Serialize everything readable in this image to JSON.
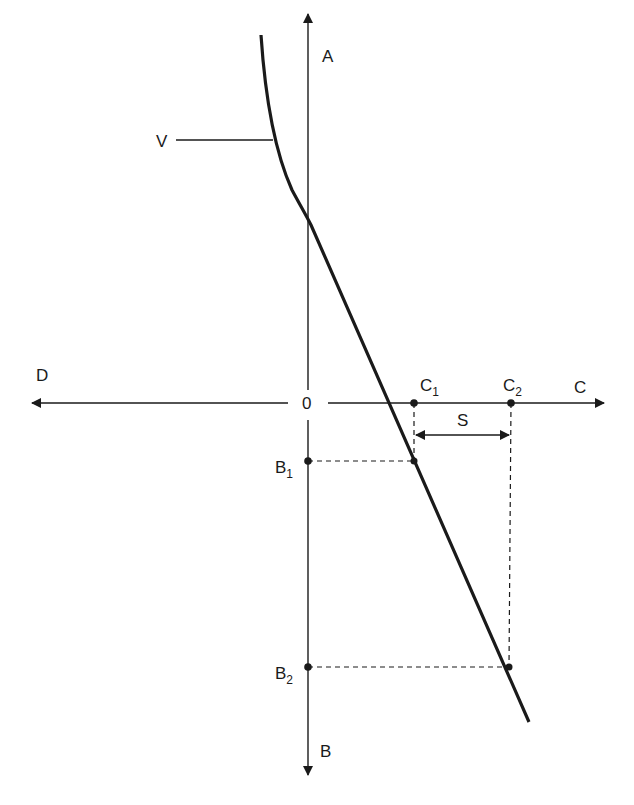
{
  "diagram": {
    "type": "axis-curve-diagram",
    "colors": {
      "line": "#1a1a1a",
      "background": "#ffffff"
    },
    "axes": {
      "origin_label": "0",
      "up_label": "A",
      "down_label": "B",
      "right_label": "C",
      "left_label": "D"
    },
    "curve": {
      "label": "V"
    },
    "points": {
      "c1": {
        "label": "C",
        "subscript": "1"
      },
      "c2": {
        "label": "C",
        "subscript": "2"
      },
      "b1": {
        "label": "B",
        "subscript": "1"
      },
      "b2": {
        "label": "B",
        "subscript": "2"
      }
    },
    "interval": {
      "label": "S",
      "from": "C1",
      "to": "C2"
    }
  }
}
